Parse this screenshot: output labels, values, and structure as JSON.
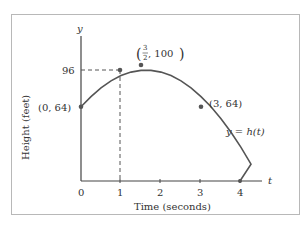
{
  "chart_data": {
    "type": "line",
    "title": "",
    "xlabel": "Time (seconds)",
    "ylabel": "Height (feet)",
    "x_axis_var": "t",
    "y_axis_var": "y",
    "curve_label": "y = h(t)",
    "function": "h(t) = -16t^2 + 48t + 64",
    "x_ticks": [
      "0",
      "1",
      "2",
      "3",
      "4"
    ],
    "y_ticks": [
      "96"
    ],
    "xlim": [
      0,
      4.3
    ],
    "ylim": [
      0,
      110
    ],
    "grid": false,
    "x": [
      0,
      0.5,
      1,
      1.5,
      2,
      2.5,
      3,
      3.5,
      4
    ],
    "values": [
      64,
      84,
      96,
      100,
      96,
      84,
      64,
      36,
      0
    ],
    "marked_points": [
      {
        "label": "(0, 64)",
        "t": 0,
        "y": 64
      },
      {
        "label": "(3/2, 100)",
        "t": 1.5,
        "y": 100
      },
      {
        "label": "(3, 64)",
        "t": 3,
        "y": 64
      },
      {
        "label": "",
        "t": 1,
        "y": 96
      }
    ],
    "guide_lines": [
      {
        "t": 1,
        "y": 96,
        "style": "dashed"
      }
    ]
  },
  "labels": {
    "y_var": "y",
    "t_var": "t",
    "y_tick_96": "96",
    "x_tick_0": "0",
    "x_tick_1": "1",
    "x_tick_2": "2",
    "x_tick_3": "3",
    "x_tick_4": "4",
    "point_start": "(0, 64)",
    "point_vertex_num": "3",
    "point_vertex_den": "2",
    "point_vertex_rest": ", 100",
    "point_3": "(3, 64)",
    "curve": "y = h(t)",
    "xlabel": "Time (seconds)",
    "ylabel": "Height (feet)"
  },
  "colors": {
    "axis": "#444444",
    "curve": "#555555",
    "frame": "#b8b8b8",
    "text": "#333333"
  }
}
